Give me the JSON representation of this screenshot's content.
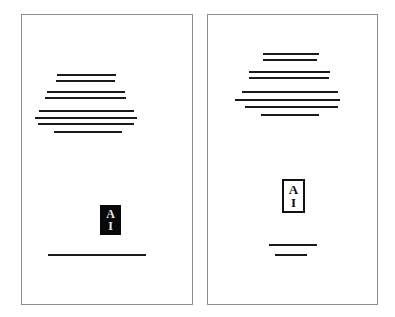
{
  "document": {
    "kind": "two-page-scan",
    "page_count": 2,
    "background_color": "#ffffff",
    "page_border_color": "#8d8d8d",
    "text_bar_color": "#1a1a1a"
  },
  "pages": [
    {
      "id": "page-left",
      "name": "left-page",
      "rect": {
        "x": 21,
        "y": 14,
        "w": 172,
        "h": 291
      },
      "text_block": {
        "name": "upper-text-block",
        "lines": [
          {
            "x": 56,
            "y": 73,
            "w": 59,
            "h": 2
          },
          {
            "x": 55,
            "y": 79,
            "w": 59,
            "h": 2
          },
          {
            "x": 46,
            "y": 90,
            "w": 78,
            "h": 2
          },
          {
            "x": 44,
            "y": 96,
            "w": 81,
            "h": 2
          },
          {
            "x": 38,
            "y": 109,
            "w": 95,
            "h": 2
          },
          {
            "x": 34,
            "y": 116,
            "w": 102,
            "h": 2
          },
          {
            "x": 37,
            "y": 122,
            "w": 96,
            "h": 2
          },
          {
            "x": 53,
            "y": 130,
            "w": 68,
            "h": 2
          }
        ]
      },
      "logo": {
        "name": "ai-logo-inverted",
        "style": "inverted",
        "letters": [
          "A",
          "I"
        ],
        "rect": {
          "x": 99,
          "y": 204,
          "w": 21,
          "h": 30
        }
      },
      "footer_lines": [
        {
          "x": 47,
          "y": 253,
          "w": 98,
          "h": 2
        }
      ]
    },
    {
      "id": "page-right",
      "name": "right-page",
      "rect": {
        "x": 207,
        "y": 14,
        "w": 171,
        "h": 291
      },
      "text_block": {
        "name": "upper-text-block",
        "lines": [
          {
            "x": 262,
            "y": 52,
            "w": 56,
            "h": 2
          },
          {
            "x": 262,
            "y": 58,
            "w": 54,
            "h": 2
          },
          {
            "x": 248,
            "y": 70,
            "w": 81,
            "h": 2
          },
          {
            "x": 248,
            "y": 76,
            "w": 80,
            "h": 2
          },
          {
            "x": 241,
            "y": 90,
            "w": 96,
            "h": 2
          },
          {
            "x": 234,
            "y": 98,
            "w": 105,
            "h": 2
          },
          {
            "x": 244,
            "y": 105,
            "w": 93,
            "h": 2
          },
          {
            "x": 260,
            "y": 113,
            "w": 58,
            "h": 2
          }
        ]
      },
      "logo": {
        "name": "ai-logo-outlined",
        "style": "outlined",
        "letters": [
          "A",
          "I"
        ],
        "rect": {
          "x": 281,
          "y": 178,
          "w": 23,
          "h": 34
        }
      },
      "footer_lines": [
        {
          "x": 268,
          "y": 243,
          "w": 48,
          "h": 2
        },
        {
          "x": 274,
          "y": 253,
          "w": 32,
          "h": 2
        }
      ]
    }
  ]
}
